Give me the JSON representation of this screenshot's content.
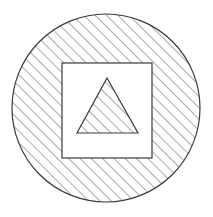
{
  "figure": {
    "title": "Hatched circle containing unhatched square containing hatched triangle",
    "canvas": {
      "width": 213,
      "height": 217,
      "background": "#ffffff"
    },
    "hatch": {
      "name": "diagonal-hatch-45",
      "angle_deg": 45,
      "direction": "lower-left to upper-right",
      "spacing_px": 8,
      "stroke_width": 1,
      "color": "#555555"
    },
    "stroke_color": "#3a3a3a",
    "fill_color": "#ffffff",
    "shapes": [
      {
        "id": "circle",
        "type": "circle",
        "label": "Outer circle",
        "cx": 106,
        "cy": 108,
        "r": 94,
        "filled": "hatched",
        "stroke_width": 1.2
      },
      {
        "id": "square",
        "type": "square",
        "label": "Inner square",
        "x": 62,
        "y": 63,
        "width": 90,
        "height": 95,
        "filled": "white",
        "stroke_width": 1.2
      },
      {
        "id": "triangle",
        "type": "triangle",
        "label": "Inner triangle",
        "points": "107,78 138,133 77,133",
        "apex_x": 107,
        "apex_y": 78,
        "base_left_x": 77,
        "base_right_x": 138,
        "base_y": 133,
        "filled": "hatched",
        "stroke_width": 1.2
      }
    ]
  }
}
